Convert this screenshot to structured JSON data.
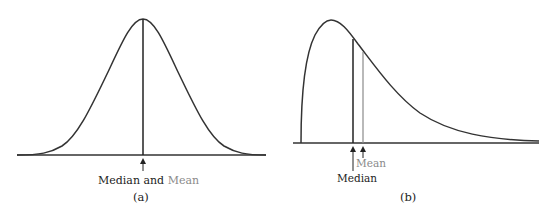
{
  "panel_a": {
    "caption": "(a)",
    "label_median": "Median and",
    "label_mean": "Mean",
    "description": "Symmetric distribution: median and mean coincide"
  },
  "panel_b": {
    "caption": "(b)",
    "label_median": "Median",
    "label_mean": "Mean",
    "description": "Right-skewed distribution: mean lies to the right of the median"
  },
  "colors": {
    "curve": "#333333",
    "median_line": "#222222",
    "mean_line": "#8a8a8a"
  }
}
